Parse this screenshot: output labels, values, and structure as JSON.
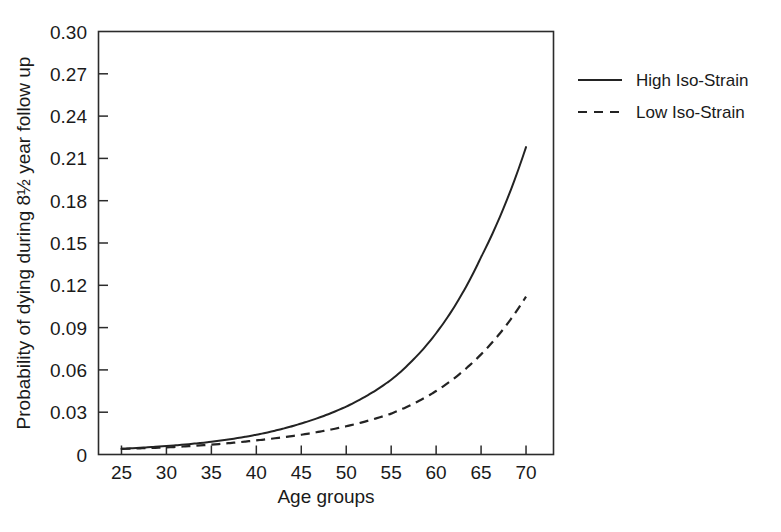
{
  "chart_data": {
    "type": "line",
    "title": "",
    "xlabel": "Age groups",
    "ylabel": "Probability of dying during 8½ year follow up",
    "xlim": [
      22.5,
      73.0
    ],
    "ylim": [
      0,
      0.3
    ],
    "grid": false,
    "legend_position": "right-outside",
    "x_ticks": [
      25,
      30,
      35,
      40,
      45,
      50,
      55,
      60,
      65,
      70
    ],
    "x_tick_labels": [
      "25",
      "30",
      "35",
      "40",
      "45",
      "50",
      "55",
      "60",
      "65",
      "70"
    ],
    "y_ticks": [
      0,
      0.03,
      0.06,
      0.09,
      0.12,
      0.15,
      0.18,
      0.21,
      0.24,
      0.27,
      0.3
    ],
    "y_tick_labels": [
      "0",
      "0.03",
      "0.06",
      "0.09",
      "0.12",
      "0.15",
      "0.18",
      "0.21",
      "0.24",
      "0.27",
      "0.30"
    ],
    "x": [
      25,
      30,
      35,
      40,
      45,
      50,
      55,
      60,
      65,
      70
    ],
    "series": [
      {
        "name": "High Iso-Strain",
        "style": "solid",
        "color": "#232323",
        "values": [
          0.004,
          0.006,
          0.009,
          0.014,
          0.022,
          0.034,
          0.053,
          0.086,
          0.14,
          0.218
        ]
      },
      {
        "name": "Low Iso-Strain",
        "style": "dashed",
        "color": "#232323",
        "values": [
          0.004,
          0.005,
          0.007,
          0.01,
          0.014,
          0.02,
          0.029,
          0.045,
          0.071,
          0.112
        ]
      }
    ]
  },
  "axes": {
    "x_title": "Age groups",
    "y_title": "Probability of dying during 8½ year follow up"
  },
  "legend": {
    "entries": [
      {
        "label": "High Iso-Strain",
        "style": "solid"
      },
      {
        "label": "Low Iso-Strain",
        "style": "dashed"
      }
    ]
  },
  "colors": {
    "ink": "#232323",
    "frame": "#2b2b2b",
    "background": "#ffffff"
  }
}
